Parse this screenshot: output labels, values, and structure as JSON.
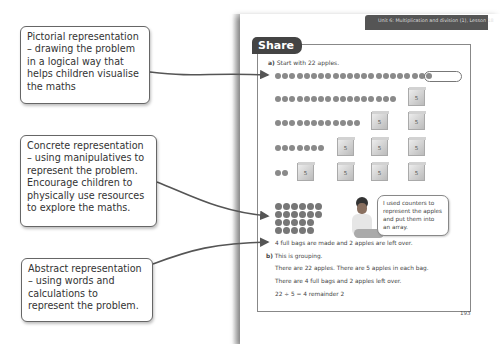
{
  "callouts": [
    {
      "id": "pictorial",
      "text": "Pictorial representation – drawing the problem in a logical way that helps children visualise the maths"
    },
    {
      "id": "concrete",
      "text": "Concrete representation – using manipulatives to represent the problem. Encourage children to physically use resources to explore the maths."
    },
    {
      "id": "abstract",
      "text": "Abstract representation – using words and calculations to represent the problem."
    }
  ],
  "page": {
    "header": "Unit 6: Multiplication and division (1), Lesson 18",
    "section_title": "Share",
    "part_a": {
      "label": "a)",
      "intro": "Start with 22 apples.",
      "rows": [
        {
          "apples": 22,
          "bags": 0
        },
        {
          "apples": 17,
          "bags": 1
        },
        {
          "apples": 12,
          "bags": 2
        },
        {
          "apples": 7,
          "bags": 3
        },
        {
          "apples": 2,
          "bags": 4
        }
      ],
      "bag_label": "5",
      "speech_bubble": "I used counters to represent the apples and put them into an array.",
      "result": "4 full bags are made and 2 apples are left over."
    },
    "part_b": {
      "label": "b)",
      "intro": "This is grouping.",
      "line1": "There are 22 apples. There are 5 apples in each bag.",
      "line2": "There are 4 full bags and 2 apples left over.",
      "equation": "22 ÷ 5 = 4 remainder 2"
    },
    "page_number": "193"
  }
}
